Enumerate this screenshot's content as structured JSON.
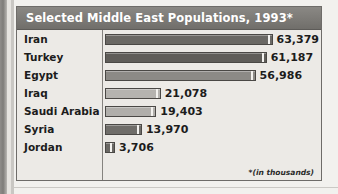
{
  "chart_panel": {
    "title": "Selected Middle East Populations, 1993*",
    "footnote": "*(in thousands)",
    "colors": {
      "title_bar": "#7c7a76",
      "title_text": "#ffffff",
      "panel_background": "#eceae6",
      "border": "#6e6c69",
      "divider": "#85837f",
      "bar_dark": "#6a6864",
      "bar_medium": "#8c8a86",
      "bar_light": "#b5b3af"
    }
  },
  "chart_data": {
    "type": "bar",
    "orientation": "horizontal",
    "title": "Selected Middle East Populations, 1993*",
    "xlabel": "",
    "ylabel": "",
    "units": "thousands",
    "grid": false,
    "legend": "none",
    "xlim": [
      0,
      70000
    ],
    "categories": [
      "Iran",
      "Turkey",
      "Egypt",
      "Iraq",
      "Saudi Arabia",
      "Syria",
      "Jordan"
    ],
    "values": [
      63379,
      61187,
      56986,
      21078,
      19403,
      13970,
      3706
    ],
    "value_labels": [
      "63,379",
      "61,187",
      "56,986",
      "21,078",
      "19,403",
      "13,970",
      "3,706"
    ],
    "bar_colors": [
      "#6a6864",
      "#5f5d59",
      "#8c8a86",
      "#b5b3af",
      "#b0aeaa",
      "#6f6d69",
      "#6a6864"
    ],
    "rows": [
      {
        "label": "Iran",
        "value": 63379,
        "value_label": "63,379",
        "bar_color": "#6a6864"
      },
      {
        "label": "Turkey",
        "value": 61187,
        "value_label": "61,187",
        "bar_color": "#5f5d59"
      },
      {
        "label": "Egypt",
        "value": 56986,
        "value_label": "56,986",
        "bar_color": "#8c8a86"
      },
      {
        "label": "Iraq",
        "value": 21078,
        "value_label": "21,078",
        "bar_color": "#b5b3af"
      },
      {
        "label": "Saudi Arabia",
        "value": 19403,
        "value_label": "19,403",
        "bar_color": "#b0aeaa"
      },
      {
        "label": "Syria",
        "value": 13970,
        "value_label": "13,970",
        "bar_color": "#6f6d69"
      },
      {
        "label": "Jordan",
        "value": 3706,
        "value_label": "3,706",
        "bar_color": "#6a6864"
      }
    ]
  }
}
